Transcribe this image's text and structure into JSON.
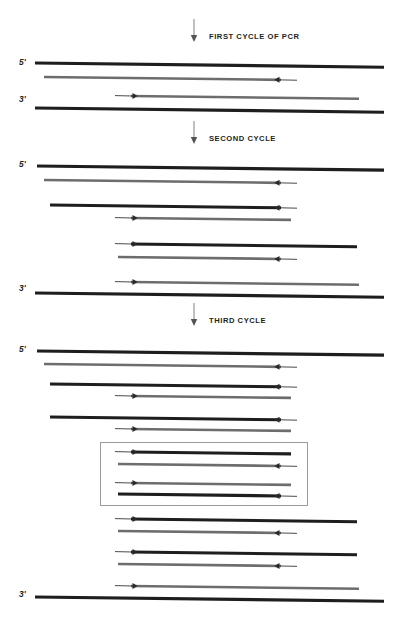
{
  "figure": {
    "colors": {
      "template_black": "#1f1d1e",
      "new_strand_gray": "#6d6d6d",
      "primer_line": "#2b2829",
      "box_border": "#9a9a9a",
      "background": "#ffffff",
      "text": "#231f20"
    }
  },
  "cycles": [
    {
      "id": "cycle-1",
      "label": "FIRST CYCLE OF PCR",
      "arrow_x": 194,
      "arrow_y": 28,
      "label_x": 209,
      "label_y": 32
    },
    {
      "id": "cycle-2",
      "label": "SECOND CYCLE",
      "arrow_x": 194,
      "arrow_y": 130,
      "label_x": 209,
      "label_y": 134
    },
    {
      "id": "cycle-3",
      "label": "THIRD CYCLE",
      "arrow_x": 194,
      "arrow_y": 312,
      "label_x": 209,
      "label_y": 316
    }
  ],
  "end_labels": [
    {
      "text": "5'",
      "x": 19,
      "y": 57
    },
    {
      "text": "3'",
      "x": 19,
      "y": 94
    },
    {
      "text": "5'",
      "x": 19,
      "y": 159
    },
    {
      "text": "3'",
      "x": 19,
      "y": 283
    },
    {
      "text": "5'",
      "x": 19,
      "y": 344
    },
    {
      "text": "3'",
      "x": 19,
      "y": 589
    }
  ],
  "highlight_box": {
    "x": 100,
    "y": 442,
    "width": 206,
    "height": 62,
    "note": "target amplicon duplexes"
  },
  "strands": [
    {
      "group": "cycle-1",
      "kind": "template",
      "color": "black",
      "thick": 3.1,
      "x1": 35,
      "x2": 384,
      "y": 63,
      "primer": null
    },
    {
      "group": "cycle-1",
      "kind": "new",
      "color": "gray",
      "thick": 2.6,
      "x1": 44,
      "x2": 281,
      "y": 77,
      "primer": {
        "dir": "left",
        "tail_x": 297
      }
    },
    {
      "group": "cycle-1",
      "kind": "new",
      "color": "gray",
      "thick": 2.6,
      "x1": 131,
      "x2": 359,
      "y": 96,
      "primer": {
        "dir": "right",
        "tail_x": 115
      }
    },
    {
      "group": "cycle-1",
      "kind": "template",
      "color": "black",
      "thick": 3.1,
      "x1": 35,
      "x2": 384,
      "y": 108,
      "primer": null
    },
    {
      "group": "cycle-2",
      "kind": "template",
      "color": "black",
      "thick": 3.1,
      "x1": 37,
      "x2": 384,
      "y": 166,
      "primer": null
    },
    {
      "group": "cycle-2",
      "kind": "new",
      "color": "gray",
      "thick": 2.6,
      "x1": 44,
      "x2": 281,
      "y": 180,
      "primer": {
        "dir": "left",
        "tail_x": 297
      }
    },
    {
      "group": "cycle-2",
      "kind": "template",
      "color": "black",
      "thick": 3.1,
      "x1": 50,
      "x2": 281,
      "y": 205,
      "primer": {
        "dir": "left",
        "tail_x": 297
      }
    },
    {
      "group": "cycle-2",
      "kind": "new",
      "color": "gray",
      "thick": 2.6,
      "x1": 131,
      "x2": 291,
      "y": 218,
      "primer": {
        "dir": "right",
        "tail_x": 115
      }
    },
    {
      "group": "cycle-2",
      "kind": "template",
      "color": "black",
      "thick": 3.1,
      "x1": 131,
      "x2": 357,
      "y": 244,
      "primer": {
        "dir": "right",
        "tail_x": 115
      }
    },
    {
      "group": "cycle-2",
      "kind": "new",
      "color": "gray",
      "thick": 2.6,
      "x1": 118,
      "x2": 281,
      "y": 257,
      "primer": {
        "dir": "left",
        "tail_x": 297
      }
    },
    {
      "group": "cycle-2",
      "kind": "new",
      "color": "gray",
      "thick": 2.6,
      "x1": 131,
      "x2": 359,
      "y": 282,
      "primer": {
        "dir": "right",
        "tail_x": 115
      }
    },
    {
      "group": "cycle-2",
      "kind": "template",
      "color": "black",
      "thick": 3.1,
      "x1": 35,
      "x2": 384,
      "y": 293,
      "primer": null
    },
    {
      "group": "cycle-3",
      "kind": "template",
      "color": "black",
      "thick": 3.1,
      "x1": 37,
      "x2": 384,
      "y": 351,
      "primer": null
    },
    {
      "group": "cycle-3",
      "kind": "new",
      "color": "gray",
      "thick": 2.6,
      "x1": 44,
      "x2": 281,
      "y": 364,
      "primer": {
        "dir": "left",
        "tail_x": 297
      }
    },
    {
      "group": "cycle-3",
      "kind": "template",
      "color": "black",
      "thick": 3.1,
      "x1": 50,
      "x2": 281,
      "y": 384,
      "primer": {
        "dir": "left",
        "tail_x": 297
      }
    },
    {
      "group": "cycle-3",
      "kind": "new",
      "color": "gray",
      "thick": 2.6,
      "x1": 131,
      "x2": 291,
      "y": 396,
      "primer": {
        "dir": "right",
        "tail_x": 115
      }
    },
    {
      "group": "cycle-3",
      "kind": "template",
      "color": "black",
      "thick": 3.1,
      "x1": 50,
      "x2": 281,
      "y": 417,
      "primer": {
        "dir": "left",
        "tail_x": 297
      }
    },
    {
      "group": "cycle-3",
      "kind": "new",
      "color": "gray",
      "thick": 2.6,
      "x1": 131,
      "x2": 291,
      "y": 429,
      "primer": {
        "dir": "right",
        "tail_x": 115
      }
    },
    {
      "group": "cycle-3-box",
      "kind": "template",
      "color": "black",
      "thick": 3.1,
      "x1": 131,
      "x2": 291,
      "y": 452,
      "primer": {
        "dir": "right",
        "tail_x": 115
      }
    },
    {
      "group": "cycle-3-box",
      "kind": "new",
      "color": "gray",
      "thick": 2.6,
      "x1": 118,
      "x2": 281,
      "y": 464,
      "primer": {
        "dir": "left",
        "tail_x": 297
      }
    },
    {
      "group": "cycle-3-box",
      "kind": "new",
      "color": "gray",
      "thick": 2.6,
      "x1": 131,
      "x2": 291,
      "y": 483,
      "primer": {
        "dir": "right",
        "tail_x": 115
      }
    },
    {
      "group": "cycle-3-box",
      "kind": "template",
      "color": "black",
      "thick": 3.1,
      "x1": 118,
      "x2": 281,
      "y": 494,
      "primer": {
        "dir": "left",
        "tail_x": 297
      }
    },
    {
      "group": "cycle-3",
      "kind": "template",
      "color": "black",
      "thick": 3.1,
      "x1": 131,
      "x2": 357,
      "y": 519,
      "primer": {
        "dir": "right",
        "tail_x": 115
      }
    },
    {
      "group": "cycle-3",
      "kind": "new",
      "color": "gray",
      "thick": 2.6,
      "x1": 118,
      "x2": 281,
      "y": 531,
      "primer": {
        "dir": "left",
        "tail_x": 297
      }
    },
    {
      "group": "cycle-3",
      "kind": "template",
      "color": "black",
      "thick": 3.1,
      "x1": 131,
      "x2": 357,
      "y": 552,
      "primer": {
        "dir": "right",
        "tail_x": 115
      }
    },
    {
      "group": "cycle-3",
      "kind": "new",
      "color": "gray",
      "thick": 2.6,
      "x1": 118,
      "x2": 281,
      "y": 564,
      "primer": {
        "dir": "left",
        "tail_x": 297
      }
    },
    {
      "group": "cycle-3",
      "kind": "new",
      "color": "gray",
      "thick": 2.6,
      "x1": 131,
      "x2": 359,
      "y": 586,
      "primer": {
        "dir": "right",
        "tail_x": 115
      }
    },
    {
      "group": "cycle-3",
      "kind": "template",
      "color": "black",
      "thick": 3.1,
      "x1": 35,
      "x2": 384,
      "y": 597,
      "primer": null
    }
  ]
}
